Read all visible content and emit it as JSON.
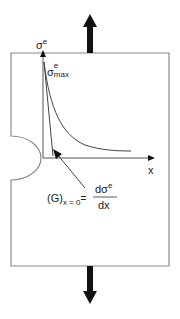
{
  "labels": {
    "y_axis": {
      "base": "σ",
      "sup": "e"
    },
    "max": {
      "base": "σ",
      "sup": "e",
      "sub": "max"
    },
    "x_axis": "x",
    "gradient": {
      "lhs": "(G)",
      "lhs_sub": "x = 0",
      "eq": "=",
      "numerator": "dσ",
      "numerator_sup": "e",
      "denominator": "dx"
    }
  },
  "colors": {
    "outline": "#8a8a8a",
    "axis": "#555555",
    "arrow": "#111111",
    "text": "#222222"
  }
}
